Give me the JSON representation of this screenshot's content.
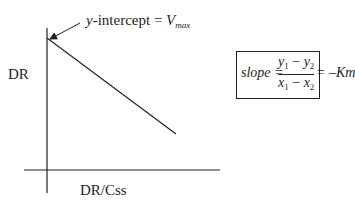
{
  "diagram": {
    "type": "lineweaver-burk-style linear plot",
    "y_axis_label": "DR",
    "x_axis_label": "DR/Css",
    "annotation": {
      "prefix": "y",
      "text": "-intercept = ",
      "var": "V",
      "sub": "max"
    },
    "formula": {
      "lhs": "slope = ",
      "num_a": "y",
      "num_a_sub": "1",
      "num_minus": " − ",
      "num_b": "y",
      "num_b_sub": "2",
      "den_a": "x",
      "den_a_sub": "1",
      "den_minus": " − ",
      "den_b": "x",
      "den_b_sub": "2",
      "rhs": " = –Km"
    },
    "colors": {
      "ink": "#231f20",
      "background": "#ffffff"
    }
  }
}
